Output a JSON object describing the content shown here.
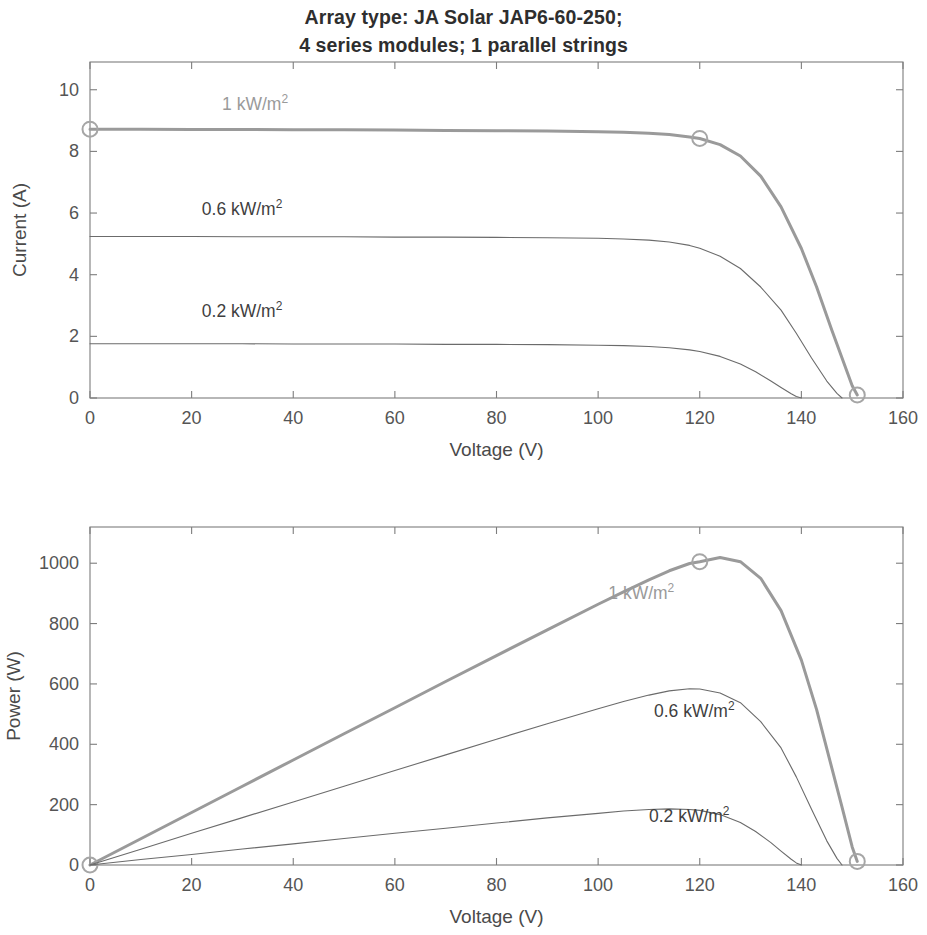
{
  "figure": {
    "title_lines": [
      "Array type: JA Solar JAP6-60-250;",
      "4 series modules; 1 parallel strings"
    ],
    "background_color": "#ffffff"
  },
  "colors": {
    "highlight_curve": "#9a9a9a",
    "normal_curve": "#6b6b6b",
    "axis": "#7d7d7d",
    "text": "#4a4a4a",
    "title_text": "#2e2e2e",
    "marker": "#a6a6a6"
  },
  "chart_data": [
    {
      "type": "line",
      "id": "iv-curve",
      "title": "",
      "xlabel": "Voltage (V)",
      "ylabel": "Current (A)",
      "xlim": [
        0,
        160
      ],
      "ylim": [
        0,
        10.9
      ],
      "xticks": [
        0,
        20,
        40,
        60,
        80,
        100,
        120,
        140,
        160
      ],
      "xtick_labels": [
        "0",
        "20",
        "40",
        "60",
        "80",
        "100",
        "120",
        "140",
        "160"
      ],
      "yticks": [
        0,
        2,
        4,
        6,
        8,
        10
      ],
      "ytick_labels": [
        "0",
        "2",
        "4",
        "6",
        "8",
        "10"
      ],
      "grid": false,
      "legend_position": "inline-annotations",
      "series": [
        {
          "name": "1 kW/m2",
          "label_text": "1 kW/m",
          "label_sup": "2",
          "label_x": 26,
          "label_y": 9.35,
          "highlight": true,
          "color": "#9a9a9a",
          "linewidth": 3.0,
          "markers": [
            {
              "x": 0,
              "y": 8.72
            },
            {
              "x": 120,
              "y": 8.42
            },
            {
              "x": 151,
              "y": 0.1
            }
          ],
          "x": [
            0,
            10,
            20,
            30,
            40,
            50,
            60,
            70,
            80,
            90,
            100,
            105,
            110,
            114,
            118,
            120,
            124,
            128,
            132,
            136,
            140,
            143,
            146,
            148,
            150,
            151
          ],
          "y": [
            8.72,
            8.72,
            8.71,
            8.71,
            8.7,
            8.7,
            8.69,
            8.68,
            8.67,
            8.66,
            8.64,
            8.62,
            8.59,
            8.55,
            8.47,
            8.42,
            8.22,
            7.85,
            7.2,
            6.2,
            4.85,
            3.6,
            2.2,
            1.3,
            0.4,
            0.1
          ]
        },
        {
          "name": "0.6 kW/m2",
          "label_text": "0.6 kW/m",
          "label_sup": "2",
          "label_x": 22,
          "label_y": 5.95,
          "highlight": false,
          "color": "#6b6b6b",
          "linewidth": 1.1,
          "markers": [],
          "x": [
            0,
            10,
            20,
            30,
            40,
            50,
            60,
            70,
            80,
            90,
            100,
            105,
            110,
            114,
            118,
            120,
            124,
            128,
            132,
            136,
            139,
            142,
            145,
            147,
            148
          ],
          "y": [
            5.24,
            5.24,
            5.24,
            5.23,
            5.23,
            5.23,
            5.22,
            5.22,
            5.21,
            5.2,
            5.18,
            5.16,
            5.12,
            5.06,
            4.95,
            4.86,
            4.6,
            4.2,
            3.6,
            2.85,
            2.1,
            1.3,
            0.55,
            0.15,
            0.0
          ]
        },
        {
          "name": "0.2 kW/m2",
          "label_text": "0.2 kW/m",
          "label_sup": "2",
          "label_x": 22,
          "label_y": 2.62,
          "highlight": false,
          "color": "#6b6b6b",
          "linewidth": 1.1,
          "markers": [],
          "x": [
            0,
            10,
            20,
            30,
            40,
            50,
            60,
            70,
            80,
            90,
            100,
            105,
            110,
            114,
            118,
            120,
            124,
            128,
            131,
            134,
            136,
            138,
            139,
            140
          ],
          "y": [
            1.76,
            1.76,
            1.76,
            1.76,
            1.75,
            1.75,
            1.75,
            1.74,
            1.74,
            1.73,
            1.71,
            1.7,
            1.67,
            1.63,
            1.56,
            1.51,
            1.35,
            1.1,
            0.85,
            0.55,
            0.34,
            0.14,
            0.05,
            0.0
          ]
        }
      ]
    },
    {
      "type": "line",
      "id": "pv-curve",
      "title": "",
      "xlabel": "Voltage (V)",
      "ylabel": "Power (W)",
      "xlim": [
        0,
        160
      ],
      "ylim": [
        0,
        1120
      ],
      "xticks": [
        0,
        20,
        40,
        60,
        80,
        100,
        120,
        140,
        160
      ],
      "xtick_labels": [
        "0",
        "20",
        "40",
        "60",
        "80",
        "100",
        "120",
        "140",
        "160"
      ],
      "yticks": [
        0,
        200,
        400,
        600,
        800,
        1000
      ],
      "ytick_labels": [
        "0",
        "200",
        "400",
        "600",
        "800",
        "1000"
      ],
      "grid": false,
      "legend_position": "inline-annotations",
      "series": [
        {
          "name": "1 kW/m2",
          "label_text": "1 kW/m",
          "label_sup": "2",
          "label_x": 102,
          "label_y": 880,
          "highlight": true,
          "color": "#9a9a9a",
          "linewidth": 3.0,
          "markers": [
            {
              "x": 0,
              "y": 0
            },
            {
              "x": 120,
              "y": 1005
            },
            {
              "x": 151,
              "y": 12
            }
          ],
          "x": [
            0,
            10,
            20,
            30,
            40,
            50,
            60,
            70,
            80,
            90,
            100,
            105,
            110,
            114,
            118,
            120,
            124,
            128,
            132,
            136,
            140,
            143,
            146,
            148,
            150,
            151
          ],
          "y": [
            0,
            87,
            174,
            261,
            348,
            435,
            521,
            608,
            694,
            779,
            864,
            905,
            945,
            975,
            999,
            1005,
            1019,
            1005,
            950,
            843,
            679,
            515,
            321,
            192,
            60,
            12
          ]
        },
        {
          "name": "0.6 kW/m2",
          "label_text": "0.6 kW/m",
          "label_sup": "2",
          "label_x": 111,
          "label_y": 492,
          "highlight": false,
          "color": "#6b6b6b",
          "linewidth": 1.1,
          "markers": [],
          "x": [
            0,
            10,
            20,
            30,
            40,
            50,
            60,
            70,
            80,
            90,
            100,
            105,
            110,
            114,
            118,
            120,
            124,
            128,
            132,
            136,
            139,
            142,
            145,
            147,
            148
          ],
          "y": [
            0,
            52,
            105,
            157,
            209,
            261,
            313,
            365,
            417,
            468,
            518,
            542,
            563,
            577,
            584,
            583,
            570,
            538,
            475,
            388,
            292,
            185,
            80,
            22,
            0
          ]
        },
        {
          "name": "0.2 kW/m2",
          "label_text": "0.2 kW/m",
          "label_sup": "2",
          "label_x": 110,
          "label_y": 142,
          "highlight": false,
          "color": "#6b6b6b",
          "linewidth": 1.1,
          "markers": [],
          "x": [
            0,
            10,
            20,
            30,
            40,
            50,
            60,
            70,
            80,
            90,
            100,
            105,
            110,
            114,
            118,
            120,
            124,
            128,
            131,
            134,
            136,
            138,
            139,
            140
          ],
          "y": [
            0,
            18,
            35,
            53,
            70,
            88,
            105,
            122,
            139,
            156,
            171,
            179,
            184,
            186,
            184,
            181,
            167,
            141,
            111,
            74,
            46,
            19,
            7,
            0
          ]
        }
      ]
    }
  ]
}
